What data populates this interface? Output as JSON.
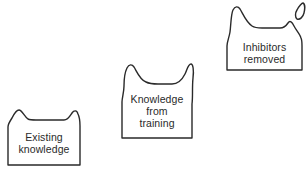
{
  "diagram": {
    "type": "stepped-progression",
    "stages": [
      {
        "id": "existing-knowledge",
        "lines": [
          "Existing",
          "knowledge"
        ]
      },
      {
        "id": "knowledge-from-training",
        "lines": [
          "Knowledge",
          "from",
          "training"
        ]
      },
      {
        "id": "inhibitors-removed",
        "lines": [
          "Inhibitors",
          "removed"
        ]
      }
    ],
    "colors": {
      "stroke": "#2a2a2a",
      "background": "#ffffff",
      "text": "#2a2a2a"
    }
  }
}
